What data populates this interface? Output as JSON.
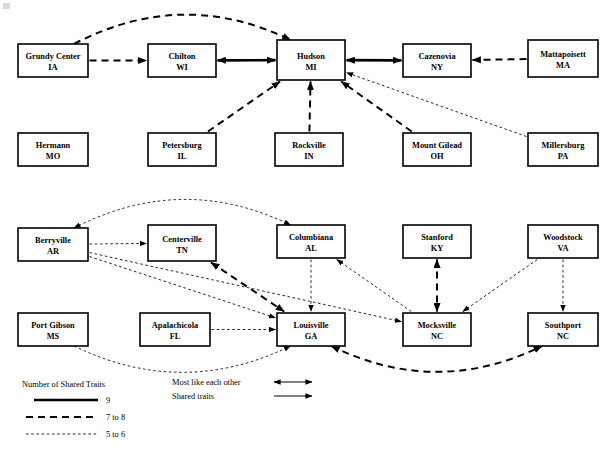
{
  "figure": {
    "title": "",
    "corner_mark": "artifact"
  },
  "nodes": [
    {
      "id": "grundy",
      "name": "Grundy Center",
      "state": "IA",
      "x": 18,
      "y": 44,
      "w": 70,
      "h": 33
    },
    {
      "id": "chilton",
      "name": "Chilton",
      "state": "WI",
      "x": 148,
      "y": 44,
      "w": 68,
      "h": 33
    },
    {
      "id": "hudson",
      "name": "Hudson",
      "state": "MI",
      "x": 277,
      "y": 40,
      "w": 68,
      "h": 40
    },
    {
      "id": "cazenovia",
      "name": "Cazenovia",
      "state": "NY",
      "x": 403,
      "y": 44,
      "w": 68,
      "h": 33
    },
    {
      "id": "mattapoisett",
      "name": "Mattapoisett",
      "state": "MA",
      "x": 528,
      "y": 40,
      "w": 70,
      "h": 37
    },
    {
      "id": "hermann",
      "name": "Hermann",
      "state": "MO",
      "x": 18,
      "y": 133,
      "w": 70,
      "h": 33
    },
    {
      "id": "petersburg",
      "name": "Petersburg",
      "state": "IL",
      "x": 148,
      "y": 133,
      "w": 68,
      "h": 33
    },
    {
      "id": "rockville",
      "name": "Rockville",
      "state": "IN",
      "x": 275,
      "y": 133,
      "w": 68,
      "h": 33
    },
    {
      "id": "mountgilead",
      "name": "Mount Gilead",
      "state": "OH",
      "x": 403,
      "y": 133,
      "w": 68,
      "h": 33
    },
    {
      "id": "millersburg",
      "name": "Millersburg",
      "state": "PA",
      "x": 528,
      "y": 133,
      "w": 70,
      "h": 33
    },
    {
      "id": "berryville",
      "name": "Berryville",
      "state": "AR",
      "x": 18,
      "y": 228,
      "w": 70,
      "h": 33
    },
    {
      "id": "centerville",
      "name": "Centerville",
      "state": "TN",
      "x": 148,
      "y": 225,
      "w": 68,
      "h": 36
    },
    {
      "id": "columbiana",
      "name": "Columbiana",
      "state": "AL",
      "x": 277,
      "y": 225,
      "w": 68,
      "h": 33
    },
    {
      "id": "stanford",
      "name": "Stanford",
      "state": "KY",
      "x": 403,
      "y": 225,
      "w": 68,
      "h": 33
    },
    {
      "id": "woodstock",
      "name": "Woodstock",
      "state": "VA",
      "x": 528,
      "y": 225,
      "w": 70,
      "h": 33
    },
    {
      "id": "portgibson",
      "name": "Port Gibson",
      "state": "MS",
      "x": 18,
      "y": 313,
      "w": 70,
      "h": 33
    },
    {
      "id": "apalachicola",
      "name": "Apalachicola",
      "state": "FL",
      "x": 140,
      "y": 313,
      "w": 70,
      "h": 33
    },
    {
      "id": "louisville",
      "name": "Louisville",
      "state": "GA",
      "x": 277,
      "y": 313,
      "w": 68,
      "h": 33
    },
    {
      "id": "mocksville",
      "name": "Mocksville",
      "state": "NC",
      "x": 403,
      "y": 313,
      "w": 68,
      "h": 33
    },
    {
      "id": "southport",
      "name": "Southport",
      "state": "NC",
      "x": 528,
      "y": 313,
      "w": 70,
      "h": 33
    }
  ],
  "edges": [
    {
      "from": "grundy",
      "to": "hudson",
      "weight": "7 to 8",
      "arrows": "one",
      "shape": "arc"
    },
    {
      "from": "grundy",
      "to": "chilton",
      "weight": "7 to 8",
      "arrows": "one",
      "shape": "straight"
    },
    {
      "from": "chilton",
      "to": "hudson",
      "weight": "9",
      "arrows": "both",
      "shape": "straight"
    },
    {
      "from": "hudson",
      "to": "cazenovia",
      "weight": "9",
      "arrows": "both",
      "shape": "straight"
    },
    {
      "from": "mattapoisett",
      "to": "cazenovia",
      "weight": "7 to 8",
      "arrows": "one",
      "shape": "straight"
    },
    {
      "from": "petersburg",
      "to": "hudson",
      "weight": "7 to 8",
      "arrows": "one",
      "shape": "straight"
    },
    {
      "from": "rockville",
      "to": "hudson",
      "weight": "7 to 8",
      "arrows": "one",
      "shape": "straight"
    },
    {
      "from": "mountgilead",
      "to": "hudson",
      "weight": "7 to 8",
      "arrows": "one",
      "shape": "straight"
    },
    {
      "from": "millersburg",
      "to": "hudson",
      "weight": "5 to 6",
      "arrows": "one",
      "shape": "straight"
    },
    {
      "from": "berryville",
      "to": "columbiana",
      "weight": "5 to 6",
      "arrows": "both",
      "shape": "arc"
    },
    {
      "from": "berryville",
      "to": "centerville",
      "weight": "5 to 6",
      "arrows": "one",
      "shape": "straight"
    },
    {
      "from": "berryville",
      "to": "louisville",
      "weight": "5 to 6",
      "arrows": "one",
      "shape": "straight"
    },
    {
      "from": "berryville",
      "to": "mocksville",
      "weight": "5 to 6",
      "arrows": "one",
      "shape": "straight"
    },
    {
      "from": "centerville",
      "to": "louisville",
      "weight": "7 to 8",
      "arrows": "both",
      "shape": "straight"
    },
    {
      "from": "columbiana",
      "to": "louisville",
      "weight": "5 to 6",
      "arrows": "one",
      "shape": "straight"
    },
    {
      "from": "mocksville",
      "to": "columbiana",
      "weight": "5 to 6",
      "arrows": "one",
      "shape": "straight"
    },
    {
      "from": "stanford",
      "to": "mocksville",
      "weight": "7 to 8",
      "arrows": "both",
      "shape": "straight"
    },
    {
      "from": "woodstock",
      "to": "mocksville",
      "weight": "5 to 6",
      "arrows": "one",
      "shape": "straight"
    },
    {
      "from": "woodstock",
      "to": "southport",
      "weight": "5 to 6",
      "arrows": "one",
      "shape": "straight"
    },
    {
      "from": "apalachicola",
      "to": "louisville",
      "weight": "5 to 6",
      "arrows": "one",
      "shape": "straight"
    },
    {
      "from": "portgibson",
      "to": "louisville",
      "weight": "5 to 6",
      "arrows": "one",
      "shape": "arc"
    },
    {
      "from": "louisville",
      "to": "southport",
      "weight": "7 to 8",
      "arrows": "both",
      "shape": "arc"
    }
  ],
  "legend": {
    "title": "Number of Shared Traits",
    "weights": [
      {
        "label": "9",
        "style": "solid-thick"
      },
      {
        "label": "7 to 8",
        "style": "dashed"
      },
      {
        "label": "5 to 6",
        "style": "dotted"
      }
    ],
    "arrow_key": [
      {
        "label": "Most like each other",
        "style": "double-headed"
      },
      {
        "label": "Shared traits",
        "style": "single-headed"
      }
    ]
  }
}
